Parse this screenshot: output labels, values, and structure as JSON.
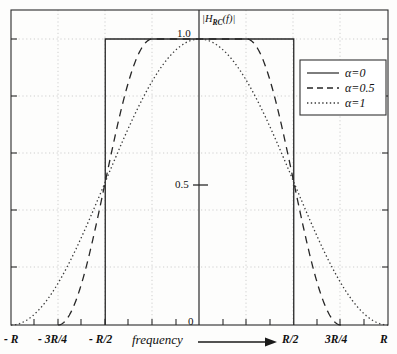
{
  "chart_data": {
    "type": "line",
    "title": "",
    "xlabel": "frequency",
    "ylabel": "|H_RC(f)|",
    "ylabel_main": "|H",
    "ylabel_sub": "RC",
    "ylabel_tail": "(f)|",
    "xlim": [
      -1.0,
      1.0
    ],
    "ylim": [
      0,
      1.08
    ],
    "grid": true,
    "legend_position": "top-right",
    "x_unit": "R",
    "xticks": [
      -1.0,
      -0.75,
      -0.5,
      0,
      0.5,
      0.75,
      1.0
    ],
    "xticklabels": [
      "- R",
      "- 3R/4",
      "- R/2",
      "0",
      "R/2",
      "3R/4",
      "R"
    ],
    "yticks": [
      0,
      0.5,
      1.0
    ],
    "yticklabels": [
      "0",
      "0.5",
      "1.0"
    ],
    "gridlines_x": [
      -1.0,
      -0.75,
      -0.5,
      -0.25,
      0,
      0.25,
      0.5,
      0.75,
      1.0
    ],
    "gridlines_y": [
      0.0,
      0.2,
      0.4,
      0.6,
      0.8,
      1.0
    ],
    "series": [
      {
        "name": "alpha=0",
        "label": "α=0",
        "alpha": 0,
        "style": "solid",
        "description": "Ideal brick-wall: |H|=1 for |f| < R/2, 0 elsewhere",
        "points_x": [
          -0.5,
          -0.5,
          0.5,
          0.5
        ],
        "points_y": [
          0,
          1,
          1,
          0
        ]
      },
      {
        "name": "alpha=0.5",
        "label": "α=0.5",
        "alpha": 0.5,
        "style": "dashed",
        "description": "Raised cosine roll-off 0.5: flat 1.0 for |f| < R/4, cosine taper to 0 at 3R/4, 0.5 at R/2",
        "points_x": [
          -0.75,
          -0.7,
          -0.65,
          -0.6,
          -0.55,
          -0.5,
          -0.45,
          -0.4,
          -0.35,
          -0.3,
          -0.25,
          0.0,
          0.25,
          0.3,
          0.35,
          0.4,
          0.45,
          0.5,
          0.55,
          0.6,
          0.65,
          0.7,
          0.75
        ],
        "points_y": [
          0.0,
          0.024,
          0.095,
          0.206,
          0.345,
          0.5,
          0.655,
          0.794,
          0.905,
          0.976,
          1.0,
          1.0,
          1.0,
          0.976,
          0.905,
          0.794,
          0.655,
          0.5,
          0.345,
          0.206,
          0.095,
          0.024,
          0.0
        ]
      },
      {
        "name": "alpha=1",
        "label": "α=1",
        "alpha": 1,
        "style": "dotted",
        "description": "Raised cosine roll-off 1: full cosine from -R to R, peak 1.0 at f=0, 0.5 at R/2",
        "points_x": [
          -1.0,
          -0.9,
          -0.8,
          -0.7,
          -0.6,
          -0.5,
          -0.4,
          -0.3,
          -0.2,
          -0.1,
          0.0,
          0.1,
          0.2,
          0.3,
          0.4,
          0.5,
          0.6,
          0.7,
          0.8,
          0.9,
          1.0
        ],
        "points_y": [
          0.0,
          0.024,
          0.095,
          0.206,
          0.345,
          0.5,
          0.655,
          0.794,
          0.905,
          0.976,
          1.0,
          0.976,
          0.905,
          0.794,
          0.655,
          0.5,
          0.345,
          0.206,
          0.095,
          0.024,
          0.0
        ]
      }
    ]
  },
  "axes": {
    "y_label_main": "|H",
    "y_label_sub": "RC",
    "y_label_tail": "(f)|",
    "y_tick_1": "1.0",
    "y_tick_05": "0.5",
    "y_tick_0": "0",
    "x_label": "frequency",
    "x_tick_minus_R": "- R",
    "x_tick_minus_3R4": "- 3R/4",
    "x_tick_minus_R2": "- R/2",
    "x_tick_R2": "R/2",
    "x_tick_3R4": "3R/4",
    "x_tick_R": "R"
  },
  "legend": {
    "entries": [
      {
        "label": "α=0",
        "style": "solid"
      },
      {
        "label": "α=0.5",
        "style": "dashed"
      },
      {
        "label": "α=1",
        "style": "dotted"
      }
    ]
  },
  "colors": {
    "background": "#fdfdfc",
    "axis": "#2b2b2b",
    "grid": "#c9c9c9",
    "curve": "#222222",
    "legend_border": "#333333"
  }
}
